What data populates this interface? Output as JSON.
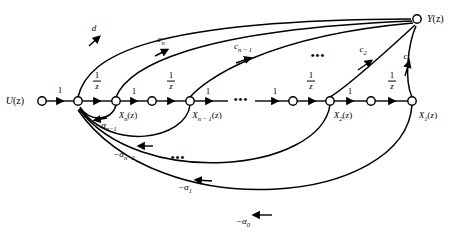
{
  "figure": {
    "type": "signal-flow-graph",
    "width": 458,
    "height": 241,
    "background": "#ffffff",
    "stroke_color": "#000000"
  },
  "nodes": [
    {
      "id": "u",
      "label": "U(z)",
      "x": 42,
      "y": 101,
      "label_x": 24,
      "label_y": 101,
      "label_anchor": "right",
      "filled": false
    },
    {
      "id": "sum",
      "label": "",
      "x": 78,
      "y": 101,
      "label_x": 78,
      "label_y": 101,
      "label_anchor": "none",
      "filled": false
    },
    {
      "id": "xn",
      "label": "Xn(z)",
      "x": 116,
      "y": 101,
      "label_x": 124,
      "label_y": 114,
      "label_anchor": "center",
      "filled": false
    },
    {
      "id": "midn",
      "label": "",
      "x": 152,
      "y": 101,
      "label_x": 152,
      "label_y": 101,
      "label_anchor": "none",
      "filled": false
    },
    {
      "id": "xn1",
      "label": "Xn-1(z)",
      "x": 190,
      "y": 101,
      "label_x": 200,
      "label_y": 114,
      "label_anchor": "center",
      "filled": false
    },
    {
      "id": "mid2",
      "label": "",
      "x": 293,
      "y": 101,
      "label_x": 293,
      "label_y": 101,
      "label_anchor": "none",
      "filled": false
    },
    {
      "id": "x2",
      "label": "X2(z)",
      "x": 330,
      "y": 101,
      "label_x": 339,
      "label_y": 114,
      "label_anchor": "center",
      "filled": false
    },
    {
      "id": "mid1",
      "label": "",
      "x": 371,
      "y": 101,
      "label_x": 371,
      "label_y": 101,
      "label_anchor": "none",
      "filled": false
    },
    {
      "id": "x1",
      "label": "X1(z)",
      "x": 412,
      "y": 101,
      "label_x": 424,
      "label_y": 114,
      "label_anchor": "center",
      "filled": false
    },
    {
      "id": "y",
      "label": "Y(z)",
      "x": 417,
      "y": 19,
      "label_x": 435,
      "label_y": 19,
      "label_anchor": "left",
      "filled": false
    }
  ],
  "node_labels": [
    {
      "name": "node-label-u",
      "x": 24,
      "y": 101,
      "base": "U",
      "sub": "",
      "suffix": "(z)",
      "size": "sz10"
    },
    {
      "name": "node-label-xn",
      "x": 128,
      "y": 116,
      "base": "X",
      "sub": "n",
      "suffix": "(z)",
      "size": "sz9"
    },
    {
      "name": "node-label-xn1",
      "x": 205,
      "y": 116,
      "base": "X",
      "sub": "n − 1",
      "suffix": "(z)",
      "size": "sz9"
    },
    {
      "name": "node-label-x2",
      "x": 343,
      "y": 116,
      "base": "X",
      "sub": "2",
      "suffix": "(z)",
      "size": "sz9"
    },
    {
      "name": "node-label-x1",
      "x": 428,
      "y": 116,
      "base": "X",
      "sub": "1",
      "suffix": "(z)",
      "size": "sz9"
    },
    {
      "name": "node-label-y",
      "x": 436,
      "y": 19,
      "base": "Y",
      "sub": "",
      "suffix": "(z)",
      "size": "sz10"
    }
  ],
  "branch_gains": {
    "unity": [
      {
        "name": "gain-unity-u-sum",
        "label": "1",
        "x": 60,
        "y": 90
      },
      {
        "name": "gain-unity-xn-mid",
        "label": "1",
        "x": 134,
        "y": 91
      },
      {
        "name": "gain-unity-xn1-next",
        "label": "1",
        "x": 208,
        "y": 91
      },
      {
        "name": "gain-unity-mid-2",
        "label": "1",
        "x": 275,
        "y": 91
      },
      {
        "name": "gain-unity-x2-mid1",
        "label": "1",
        "x": 350,
        "y": 91
      }
    ],
    "delays": [
      {
        "name": "gain-delay-1",
        "num": "1",
        "den": "z",
        "x": 97,
        "y": 81
      },
      {
        "name": "gain-delay-2",
        "num": "1",
        "den": "z",
        "x": 171,
        "y": 81
      },
      {
        "name": "gain-delay-3",
        "num": "1",
        "den": "z",
        "x": 311,
        "y": 81
      },
      {
        "name": "gain-delay-4",
        "num": "1",
        "den": "z",
        "x": 392,
        "y": 81
      }
    ],
    "feedforward": [
      {
        "name": "gain-d",
        "base": "d",
        "sub": "",
        "x": 94,
        "y": 30
      },
      {
        "name": "gain-cn",
        "base": "c",
        "sub": "n",
        "x": 161,
        "y": 41
      },
      {
        "name": "gain-cn-1",
        "base": "c",
        "sub": "n − 1",
        "x": 243,
        "y": 48
      },
      {
        "name": "gain-c2",
        "base": "c",
        "sub": "2",
        "x": 363,
        "y": 51
      },
      {
        "name": "gain-c1",
        "base": "c",
        "sub": "1",
        "x": 407,
        "y": 58
      }
    ],
    "feedback": [
      {
        "name": "gain-alpha-n-1",
        "prefix": "−α",
        "sub": "n−1",
        "x": 106,
        "y": 127
      },
      {
        "name": "gain-alpha-n-2",
        "prefix": "−α",
        "sub": "n−2",
        "x": 124,
        "y": 156
      },
      {
        "name": "gain-alpha-1",
        "prefix": "−α",
        "sub": "1",
        "x": 185,
        "y": 189
      },
      {
        "name": "gain-alpha-0",
        "prefix": "−α",
        "sub": "0",
        "x": 243,
        "y": 223
      }
    ]
  },
  "ellipses": [
    {
      "name": "ellipsis-main-chain",
      "x": 241,
      "y": 99,
      "text": "•••"
    },
    {
      "name": "ellipsis-feedforward",
      "x": 318,
      "y": 55,
      "text": "•••"
    },
    {
      "name": "ellipsis-feedback",
      "x": 178,
      "y": 157,
      "text": "•••"
    }
  ]
}
